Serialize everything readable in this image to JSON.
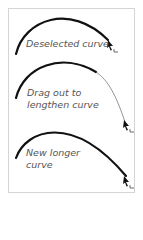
{
  "panels": [
    {
      "id": "deselected",
      "lines": [
        "Deselected curve"
      ]
    },
    {
      "id": "drag",
      "lines": [
        "Drag out to",
        "lengthen curve"
      ]
    },
    {
      "id": "new",
      "lines": [
        "New longer",
        "curve"
      ]
    }
  ],
  "colors": {
    "curve": "#111111",
    "label": "#555555",
    "frame_border": "#d4d4d4",
    "drag_line": "#777777"
  },
  "icons": [
    "curve-pen-pointer-icon"
  ]
}
